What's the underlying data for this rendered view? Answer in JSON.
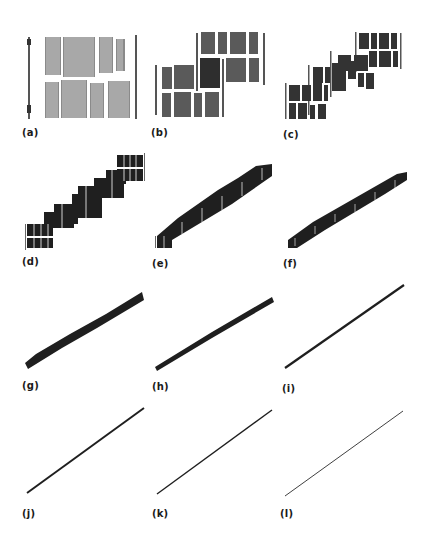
{
  "figure": {
    "panels": [
      {
        "id": "a",
        "label": "(a)",
        "description": "page image with text column blocks, no shear"
      },
      {
        "id": "b",
        "label": "(b)",
        "description": "page split into two shifted block groups"
      },
      {
        "id": "c",
        "label": "(c)",
        "description": "page split into three shifted block groups"
      },
      {
        "id": "d",
        "label": "(d)",
        "description": "staircase of blocks along diagonal"
      },
      {
        "id": "e",
        "label": "(e)",
        "description": "finer staircase of blocks along diagonal"
      },
      {
        "id": "f",
        "label": "(f)",
        "description": "narrow diagonal band of blocks"
      },
      {
        "id": "g",
        "label": "(g)",
        "description": "thin diagonal band"
      },
      {
        "id": "h",
        "label": "(h)",
        "description": "thinner diagonal band"
      },
      {
        "id": "i",
        "label": "(i)",
        "description": "near-line diagonal"
      },
      {
        "id": "j",
        "label": "(j)",
        "description": "diagonal line"
      },
      {
        "id": "k",
        "label": "(k)",
        "description": "thin diagonal line"
      },
      {
        "id": "l",
        "label": "(l)",
        "description": "very thin diagonal line"
      }
    ]
  },
  "colors": {
    "ink": "#1a1a1a",
    "gray_text": "#7a7a7a",
    "dark_block": "#2a2a2a",
    "background": "#ffffff"
  }
}
